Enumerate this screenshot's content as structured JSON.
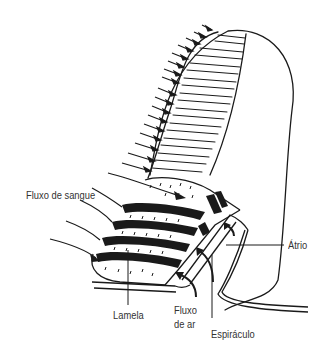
{
  "diagram": {
    "labels": {
      "blood_flow": "Fluxo de sangue",
      "lamella": "Lamela",
      "air_flow_line1": "Fluxo",
      "air_flow_line2": "de ar",
      "spiracle": "Espiráculo",
      "atrium": "Átrio"
    },
    "colors": {
      "ink": "#1a1a1a",
      "background": "#ffffff",
      "label_text": "#333333"
    }
  }
}
